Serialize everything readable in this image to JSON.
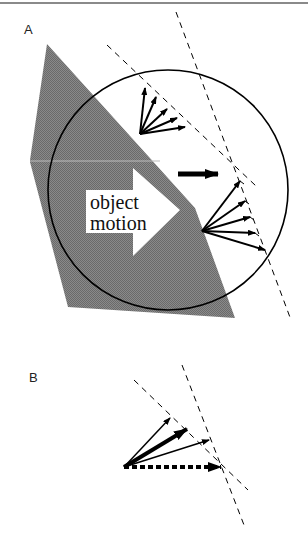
{
  "panels": {
    "a": {
      "label": "A",
      "object_text_line1": "object",
      "object_text_line2": "motion"
    },
    "b": {
      "label": "B"
    }
  },
  "colors": {
    "object_fill": "#7a7a7a",
    "stroke": "#000000",
    "background": "#ffffff",
    "border": "#8a8a8a"
  }
}
